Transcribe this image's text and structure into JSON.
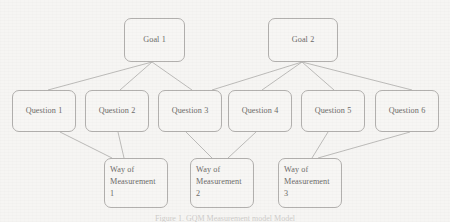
{
  "diagram": {
    "type": "tree",
    "colors": {
      "background": "#f6f5f3",
      "node_fill": "#f7f6f4",
      "node_border": "#b2b0ae",
      "text": "#6e6c6a",
      "edge": "#b6b4b2"
    },
    "caption": "Figure 1. GQM Measurement model Model",
    "levels": [
      {
        "name": "goals",
        "label": "Goal level"
      },
      {
        "name": "questions",
        "label": "Question level"
      },
      {
        "name": "metrics",
        "label": "Way of Measurement level"
      }
    ],
    "nodes": [
      {
        "id": "g1",
        "label": "Goal 1",
        "level": "goals",
        "x": 124,
        "y": 18,
        "w": 61,
        "h": 44
      },
      {
        "id": "g2",
        "label": "Goal 2",
        "level": "goals",
        "x": 268,
        "y": 18,
        "w": 70,
        "h": 44
      },
      {
        "id": "q1",
        "label": "Question 1",
        "level": "questions",
        "x": 12,
        "y": 90,
        "w": 64,
        "h": 42
      },
      {
        "id": "q2",
        "label": "Question 2",
        "level": "questions",
        "x": 85,
        "y": 90,
        "w": 64,
        "h": 42
      },
      {
        "id": "q3",
        "label": "Question 3",
        "level": "questions",
        "x": 158,
        "y": 90,
        "w": 64,
        "h": 42
      },
      {
        "id": "q4",
        "label": "Question 4",
        "level": "questions",
        "x": 228,
        "y": 90,
        "w": 64,
        "h": 42
      },
      {
        "id": "q5",
        "label": "Question 5",
        "level": "questions",
        "x": 301,
        "y": 90,
        "w": 64,
        "h": 42
      },
      {
        "id": "q6",
        "label": "Question 6",
        "level": "questions",
        "x": 375,
        "y": 90,
        "w": 64,
        "h": 42
      },
      {
        "id": "m1",
        "label": "Way of\nMeasurement\n1",
        "line1": "Way of",
        "line2": "Measurement",
        "line3": "1",
        "level": "metrics",
        "x": 104,
        "y": 158,
        "w": 64,
        "h": 50
      },
      {
        "id": "m2",
        "label": "Way of\nMeasurement\n2",
        "line1": "Way of",
        "line2": "Measurement",
        "line3": "2",
        "level": "metrics",
        "x": 190,
        "y": 158,
        "w": 64,
        "h": 50
      },
      {
        "id": "m3",
        "label": "Way of\nMeasurement\n3",
        "line1": "Way of",
        "line2": "Measurement",
        "line3": "3",
        "level": "metrics",
        "x": 278,
        "y": 158,
        "w": 64,
        "h": 50
      }
    ],
    "edges": [
      {
        "from": "g1",
        "to": "q1",
        "x1": 152,
        "y1": 62,
        "x2": 48,
        "y2": 90
      },
      {
        "from": "g1",
        "to": "q2",
        "x1": 152,
        "y1": 62,
        "x2": 120,
        "y2": 90
      },
      {
        "from": "g1",
        "to": "q3",
        "x1": 152,
        "y1": 62,
        "x2": 192,
        "y2": 90
      },
      {
        "from": "g2",
        "to": "q3",
        "x1": 302,
        "y1": 62,
        "x2": 212,
        "y2": 90
      },
      {
        "from": "g2",
        "to": "q4",
        "x1": 302,
        "y1": 62,
        "x2": 262,
        "y2": 90
      },
      {
        "from": "g2",
        "to": "q5",
        "x1": 302,
        "y1": 62,
        "x2": 334,
        "y2": 90
      },
      {
        "from": "g2",
        "to": "q6",
        "x1": 302,
        "y1": 62,
        "x2": 412,
        "y2": 90
      },
      {
        "from": "q1",
        "to": "m1",
        "x1": 60,
        "y1": 132,
        "x2": 112,
        "y2": 158
      },
      {
        "from": "q2",
        "to": "m1",
        "x1": 118,
        "y1": 132,
        "x2": 124,
        "y2": 158
      },
      {
        "from": "q3",
        "to": "m2",
        "x1": 186,
        "y1": 132,
        "x2": 212,
        "y2": 158
      },
      {
        "from": "q4",
        "to": "m2",
        "x1": 256,
        "y1": 132,
        "x2": 228,
        "y2": 158
      },
      {
        "from": "q5",
        "to": "m3",
        "x1": 328,
        "y1": 132,
        "x2": 312,
        "y2": 158
      },
      {
        "from": "q6",
        "to": "m3",
        "x1": 410,
        "y1": 132,
        "x2": 318,
        "y2": 158
      }
    ]
  }
}
